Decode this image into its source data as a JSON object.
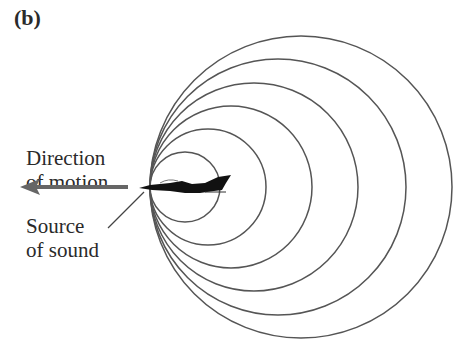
{
  "panel_label": "(b)",
  "labels": {
    "direction_line1": "Direction",
    "direction_line2": "of motion",
    "source_line1": "Source",
    "source_line2": "of sound"
  },
  "diagram": {
    "type": "doppler-wavefronts",
    "tangent_point": [
      150,
      187
    ],
    "circle_radii": [
      35,
      58,
      81,
      104,
      128,
      151
    ],
    "stroke_color": "#555555",
    "arrow_color": "#666666"
  }
}
